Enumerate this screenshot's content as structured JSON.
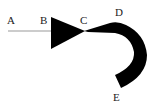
{
  "diagram": {
    "labels": {
      "a": "A",
      "b": "B",
      "c": "C",
      "d": "D",
      "e": "E"
    },
    "colors": {
      "shape_fill": "#000000",
      "line": "#999999",
      "text": "#222222",
      "background": "#ffffff"
    }
  }
}
